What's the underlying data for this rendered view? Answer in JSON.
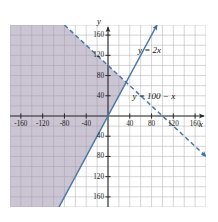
{
  "chart_data": {
    "type": "line",
    "title": "",
    "xlabel": "x",
    "ylabel": "y",
    "xlim": [
      -180,
      180
    ],
    "ylim": [
      -180,
      180
    ],
    "grid": true,
    "grid_step": 20,
    "legend": "none",
    "x_ticks": [
      -160,
      -120,
      -80,
      -40,
      40,
      80,
      120,
      160
    ],
    "y_ticks": [
      160,
      120,
      80,
      40,
      -40,
      -80,
      -120,
      -160
    ],
    "x_tick_labels": [
      "-160",
      "-120",
      "-80",
      "-40",
      "40",
      "80",
      "120",
      "160"
    ],
    "y_tick_labels": [
      "160",
      "120",
      "80",
      "40",
      "40",
      "80",
      "120",
      "160"
    ],
    "series": [
      {
        "name": "y = 2x",
        "label": "y = 2x",
        "equation": "y = 2x",
        "slope": 2,
        "intercept": 0,
        "style": "solid",
        "color": "#4a78a8",
        "arrows": "both",
        "points": [
          [
            -90,
            -180
          ],
          [
            0,
            0
          ],
          [
            90,
            180
          ]
        ]
      },
      {
        "name": "y = 100 - x",
        "label": "y = 100 − x",
        "equation": "y = 100 − x",
        "slope": -1,
        "intercept": 100,
        "style": "dashed",
        "color": "#4a78a8",
        "arrows": "both",
        "points": [
          [
            -80,
            180
          ],
          [
            0,
            100
          ],
          [
            100,
            0
          ],
          [
            180,
            -80
          ]
        ]
      }
    ],
    "shaded_region": {
      "description": "Region left of y = 2x and below y = 100 - x",
      "fill": "#9f94ae",
      "opacity": 0.55,
      "vertices": [
        [
          -180,
          180
        ],
        [
          -80,
          180
        ],
        [
          33.3,
          66.7
        ],
        [
          -90,
          -180
        ],
        [
          -180,
          -180
        ]
      ]
    },
    "intersection": [
      33.3,
      66.7
    ]
  },
  "annotations": {
    "line1_label": "y = 2x",
    "line2_label": "y = 100 − x",
    "x_axis_label": "x",
    "y_axis_label": "y"
  },
  "colors": {
    "line": "#4a78a8",
    "shade": "#9f94ae",
    "grid": "#b9b9b9",
    "axis": "#2a2a2a",
    "text": "#1b1b1b",
    "background": "#ffffff"
  }
}
